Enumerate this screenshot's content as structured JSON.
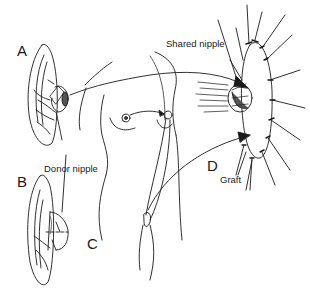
{
  "figure": {
    "panels": {
      "A": "A",
      "B": "B",
      "C": "C",
      "D": "D"
    },
    "annotations": {
      "shared_nipple": "Shared nipple",
      "donor_nipple": "Donor nipple",
      "graft": "Graft"
    },
    "colors": {
      "ink": "#1a1a1a",
      "background": "#ffffff"
    }
  }
}
